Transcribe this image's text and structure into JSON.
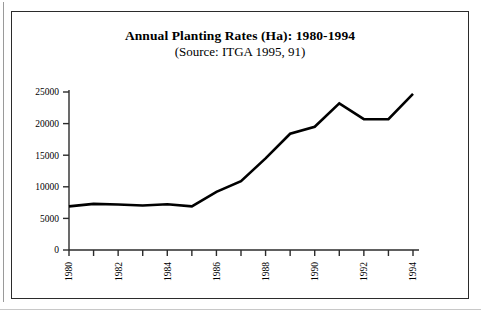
{
  "chart_data": {
    "type": "line",
    "title": "Annual Planting Rates (Ha): 1980-1994",
    "subtitle": "(Source: ITGA 1995, 91)",
    "xlabel": "",
    "ylabel": "",
    "x": [
      1980,
      1981,
      1982,
      1983,
      1984,
      1985,
      1986,
      1987,
      1988,
      1989,
      1990,
      1991,
      1992,
      1993,
      1994
    ],
    "values": [
      6900,
      7300,
      7200,
      7050,
      7250,
      6900,
      9200,
      10900,
      14500,
      18400,
      19500,
      23200,
      20700,
      20700,
      24700
    ],
    "series": [
      {
        "name": "Annual Planting Rate (Ha)",
        "values": [
          6900,
          7300,
          7200,
          7050,
          7250,
          6900,
          9200,
          10900,
          14500,
          18400,
          19500,
          23200,
          20700,
          20700,
          24700
        ]
      }
    ],
    "categories": [
      "1980",
      "1981",
      "1982",
      "1983",
      "1984",
      "1985",
      "1986",
      "1987",
      "1988",
      "1989",
      "1990",
      "1991",
      "1992",
      "1993",
      "1994"
    ],
    "xtick_labels": [
      "1980",
      "",
      "1982",
      "",
      "1984",
      "",
      "1986",
      "",
      "1988",
      "",
      "1990",
      "",
      "1992",
      "",
      "1994"
    ],
    "ytick_labels": [
      "0",
      "5000",
      "10000",
      "15000",
      "20000",
      "25000"
    ],
    "ytick_values": [
      0,
      5000,
      10000,
      15000,
      20000,
      25000
    ],
    "ylim": [
      0,
      25000
    ],
    "xlim": [
      1980,
      1994
    ],
    "grid": false,
    "legend": false,
    "legend_position": "none",
    "line_color": "#000000",
    "axis_color": "#2b2b2b",
    "background_color": "#ffffff"
  }
}
